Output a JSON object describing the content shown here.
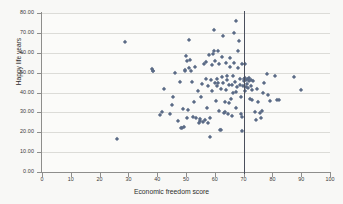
{
  "chart_data": {
    "type": "scatter",
    "title": "",
    "xlabel": "Economic freedom score",
    "ylabel": "Happy life years",
    "xlim": [
      0,
      100
    ],
    "ylim": [
      0,
      80
    ],
    "xticks": [
      "0",
      "10",
      "20",
      "30",
      "40",
      "50",
      "60",
      "70",
      "80",
      "90",
      "100"
    ],
    "yticks": [
      "0.00",
      "10.00",
      "20.00",
      "30.00",
      "40.00",
      "50.00",
      "60.00",
      "70.00",
      "80.00"
    ],
    "grid": "horizontal",
    "legend": "none",
    "marker_shape": "diamond",
    "marker_color": "#5b6b86",
    "annotations": [
      {
        "type": "vertical-line",
        "x": 70,
        "color": "#4a4f5c",
        "label": "reference line at 70"
      }
    ],
    "points": [
      [
        26.2,
        16.5
      ],
      [
        28.8,
        65.6
      ],
      [
        38.3,
        51.9
      ],
      [
        38.4,
        51.0
      ],
      [
        38.5,
        50.6
      ],
      [
        40.8,
        28.8
      ],
      [
        41.5,
        30.3
      ],
      [
        42.2,
        41.8
      ],
      [
        44.6,
        29.4
      ],
      [
        45.0,
        33.9
      ],
      [
        45.5,
        37.7
      ],
      [
        46.3,
        49.9
      ],
      [
        47.2,
        25.5
      ],
      [
        47.8,
        45.5
      ],
      [
        48.1,
        22.3
      ],
      [
        48.5,
        22.2
      ],
      [
        48.8,
        31.6
      ],
      [
        49.2,
        22.5
      ],
      [
        49.6,
        50.7
      ],
      [
        49.8,
        51.3
      ],
      [
        50.0,
        58.4
      ],
      [
        50.2,
        55.9
      ],
      [
        50.4,
        27.3
      ],
      [
        50.8,
        31.2
      ],
      [
        51.0,
        52.1
      ],
      [
        51.2,
        66.3
      ],
      [
        51.5,
        56.6
      ],
      [
        51.8,
        50.8
      ],
      [
        52.0,
        45.3
      ],
      [
        52.4,
        27.5
      ],
      [
        52.8,
        35.3
      ],
      [
        53.2,
        53.0
      ],
      [
        53.6,
        27.0
      ],
      [
        54.0,
        40.9
      ],
      [
        54.4,
        24.7
      ],
      [
        54.8,
        25.6
      ],
      [
        55.0,
        26.5
      ],
      [
        55.3,
        37.8
      ],
      [
        55.6,
        44.2
      ],
      [
        55.9,
        25.3
      ],
      [
        56.2,
        54.2
      ],
      [
        56.5,
        26.2
      ],
      [
        56.8,
        46.9
      ],
      [
        57.0,
        55.4
      ],
      [
        57.2,
        32.0
      ],
      [
        57.5,
        24.8
      ],
      [
        57.8,
        43.5
      ],
      [
        58.0,
        58.8
      ],
      [
        58.2,
        27.3
      ],
      [
        58.5,
        17.4
      ],
      [
        58.8,
        46.2
      ],
      [
        59.0,
        41.0
      ],
      [
        59.2,
        53.8
      ],
      [
        59.4,
        59.2
      ],
      [
        59.6,
        60.9
      ],
      [
        59.8,
        71.5
      ],
      [
        60.0,
        45.0
      ],
      [
        60.2,
        55.9
      ],
      [
        60.4,
        35.7
      ],
      [
        60.6,
        43.4
      ],
      [
        60.8,
        47.0
      ],
      [
        61.0,
        44.6
      ],
      [
        61.2,
        60.7
      ],
      [
        61.4,
        54.4
      ],
      [
        61.6,
        30.5
      ],
      [
        61.8,
        21.3
      ],
      [
        62.0,
        41.8
      ],
      [
        62.2,
        21.0
      ],
      [
        62.4,
        48.0
      ],
      [
        62.6,
        58.0
      ],
      [
        62.8,
        68.2
      ],
      [
        63.0,
        44.8
      ],
      [
        63.2,
        29.5
      ],
      [
        63.4,
        35.3
      ],
      [
        63.6,
        30.2
      ],
      [
        63.8,
        55.0
      ],
      [
        64.0,
        41.4
      ],
      [
        64.2,
        46.4
      ],
      [
        64.4,
        48.5
      ],
      [
        64.6,
        29.4
      ],
      [
        64.8,
        34.8
      ],
      [
        65.0,
        44.0
      ],
      [
        65.2,
        53.0
      ],
      [
        65.4,
        57.2
      ],
      [
        65.6,
        36.5
      ],
      [
        65.8,
        28.2
      ],
      [
        66.0,
        43.8
      ],
      [
        66.2,
        48.2
      ],
      [
        66.4,
        39.8
      ],
      [
        66.6,
        54.6
      ],
      [
        66.8,
        69.8
      ],
      [
        67.0,
        45.5
      ],
      [
        67.2,
        40.2
      ],
      [
        67.4,
        32.2
      ],
      [
        67.5,
        75.8
      ],
      [
        67.8,
        42.6
      ],
      [
        68.0,
        52.2
      ],
      [
        68.2,
        61.0
      ],
      [
        68.4,
        66.0
      ],
      [
        68.6,
        44.0
      ],
      [
        68.8,
        46.6
      ],
      [
        69.0,
        37.6
      ],
      [
        69.2,
        29.0
      ],
      [
        69.4,
        27.7
      ],
      [
        69.5,
        54.1
      ],
      [
        69.6,
        20.6
      ],
      [
        69.8,
        43.4
      ],
      [
        70.0,
        45.8
      ],
      [
        70.2,
        46.8
      ],
      [
        70.4,
        47.2
      ],
      [
        70.5,
        54.2
      ],
      [
        70.6,
        40.8
      ],
      [
        70.8,
        43.0
      ],
      [
        71.0,
        46.2
      ],
      [
        71.2,
        44.4
      ],
      [
        71.4,
        47.0
      ],
      [
        71.6,
        42.2
      ],
      [
        71.8,
        45.6
      ],
      [
        72.0,
        47.1
      ],
      [
        72.2,
        36.6
      ],
      [
        72.4,
        43.2
      ],
      [
        72.6,
        46.4
      ],
      [
        72.8,
        41.5
      ],
      [
        73.0,
        36.2
      ],
      [
        73.4,
        45.8
      ],
      [
        73.8,
        30.0
      ],
      [
        74.2,
        26.4
      ],
      [
        74.6,
        42.0
      ],
      [
        75.0,
        35.4
      ],
      [
        75.6,
        29.8
      ],
      [
        76.0,
        27.2
      ],
      [
        76.4,
        30.6
      ],
      [
        76.8,
        39.5
      ],
      [
        77.2,
        45.0
      ],
      [
        78.0,
        49.4
      ],
      [
        78.6,
        38.9
      ],
      [
        79.2,
        35.6
      ],
      [
        81.0,
        48.4
      ],
      [
        81.6,
        36.2
      ],
      [
        82.4,
        36.0
      ],
      [
        87.4,
        48.0
      ],
      [
        90.0,
        41.2
      ]
    ]
  }
}
